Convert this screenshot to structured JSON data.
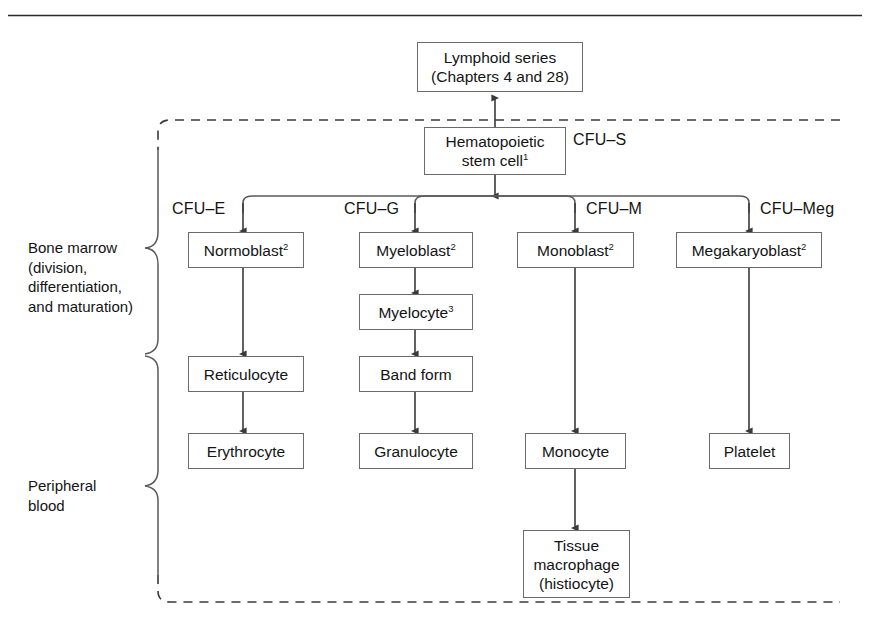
{
  "figure": {
    "type": "flow-diagram",
    "title_rule": "horizontal-rule-top",
    "region_labels": [
      {
        "id": "bone-marrow",
        "text": "Bone marrow\n(division,\ndifferentiation,\nand maturation)"
      },
      {
        "id": "peripheral-blood",
        "text": "Peripheral\nblood"
      }
    ],
    "cfu_labels": [
      {
        "id": "cfu-s",
        "text": "CFU–S"
      },
      {
        "id": "cfu-e",
        "text": "CFU–E"
      },
      {
        "id": "cfu-g",
        "text": "CFU–G"
      },
      {
        "id": "cfu-m",
        "text": "CFU–M"
      },
      {
        "id": "cfu-meg",
        "text": "CFU–Meg"
      }
    ],
    "nodes": [
      {
        "id": "lymphoid-series",
        "line1": "Lymphoid series",
        "line2": "(Chapters 4 and 28)"
      },
      {
        "id": "hematopoietic-stem-cell",
        "line1": "Hematopoietic",
        "line2": "stem cell",
        "sup2": "1"
      },
      {
        "id": "normoblast",
        "line1": "Normoblast",
        "sup1": "2"
      },
      {
        "id": "myeloblast",
        "line1": "Myeloblast",
        "sup1": "2"
      },
      {
        "id": "monoblast",
        "line1": "Monoblast",
        "sup1": "2"
      },
      {
        "id": "megakaryoblast",
        "line1": "Megakaryoblast",
        "sup1": "2"
      },
      {
        "id": "myelocyte",
        "line1": "Myelocyte",
        "sup1": "3"
      },
      {
        "id": "reticulocyte",
        "line1": "Reticulocyte"
      },
      {
        "id": "band-form",
        "line1": "Band form"
      },
      {
        "id": "erythrocyte",
        "line1": "Erythrocyte"
      },
      {
        "id": "granulocyte",
        "line1": "Granulocyte"
      },
      {
        "id": "monocyte",
        "line1": "Monocyte"
      },
      {
        "id": "platelet",
        "line1": "Platelet"
      },
      {
        "id": "tissue-macrophage",
        "line1": "Tissue",
        "line2": "macrophage",
        "line3": "(histiocyte)"
      }
    ],
    "colors": {
      "stroke": "#6b6b6b",
      "arrow": "#3a3a3a",
      "text": "#141414",
      "background": "#ffffff",
      "rule": "#2a2a2a"
    }
  }
}
